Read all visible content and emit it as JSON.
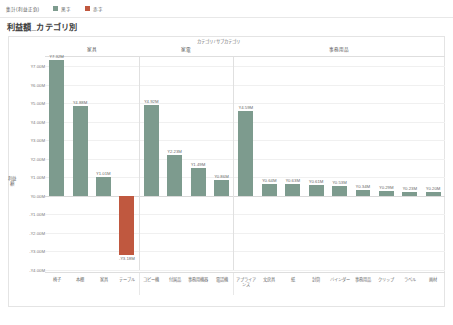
{
  "legend": {
    "title": "集計(利益正負)",
    "items": [
      {
        "label": "黒字",
        "color": "#7d9b8e"
      },
      {
        "label": "赤字",
        "color": "#c0583f"
      }
    ]
  },
  "title": "利益額_カテゴリ別",
  "axis": {
    "y_title": "利益額",
    "header_caption": "カテゴリ / サブカテゴリ"
  },
  "chart_data": {
    "type": "bar",
    "title": "利益額_カテゴリ別",
    "xlabel": "カテゴリ / サブカテゴリ",
    "ylabel": "利益額",
    "ylim": [
      -4.0,
      7.5
    ],
    "ytick_labels": [
      "¥7.00M",
      "¥6.00M",
      "¥5.00M",
      "¥4.00M",
      "¥3.00M",
      "¥2.00M",
      "¥1.00M",
      "¥0.00M",
      "-¥1.00M",
      "-¥2.00M",
      "-¥3.00M",
      "-¥4.00M"
    ],
    "ytick_values": [
      7.0,
      6.0,
      5.0,
      4.0,
      3.0,
      2.0,
      1.0,
      0.0,
      -1.0,
      -2.0,
      -3.0,
      -4.0
    ],
    "grid": true,
    "legend_position": "top",
    "panels": [
      {
        "name": "家具",
        "categories": [
          "椅子",
          "本棚",
          "家具",
          "テーブル"
        ],
        "values": [
          7.32,
          4.88,
          1.01,
          -3.18
        ],
        "labels": [
          "¥7.32M",
          "¥4.88M",
          "¥1.01M",
          "-¥3.18M"
        ],
        "colors": [
          "#7d9b8e",
          "#7d9b8e",
          "#7d9b8e",
          "#c0583f"
        ]
      },
      {
        "name": "家電",
        "categories": [
          "コピー機",
          "付属品",
          "事務用機器",
          "電話機"
        ],
        "values": [
          4.92,
          2.23,
          1.49,
          0.86
        ],
        "labels": [
          "¥4.92M",
          "¥2.23M",
          "¥1.49M",
          "¥0.86M"
        ],
        "colors": [
          "#7d9b8e",
          "#7d9b8e",
          "#7d9b8e",
          "#7d9b8e"
        ]
      },
      {
        "name": "事務用品",
        "categories": [
          "アプライアンス",
          "文房具",
          "紙",
          "封筒",
          "バインダー",
          "事務用品",
          "クリップ",
          "ラベル",
          "画材"
        ],
        "values": [
          4.59,
          0.64,
          0.63,
          0.61,
          0.53,
          0.34,
          0.29,
          0.23,
          0.2
        ],
        "labels": [
          "¥4.59M",
          "¥0.64M",
          "¥0.63M",
          "¥0.61M",
          "¥0.53M",
          "¥0.34M",
          "¥0.29M",
          "¥0.23M",
          "¥0.20M"
        ],
        "colors": [
          "#7d9b8e",
          "#7d9b8e",
          "#7d9b8e",
          "#7d9b8e",
          "#7d9b8e",
          "#7d9b8e",
          "#7d9b8e",
          "#7d9b8e",
          "#7d9b8e"
        ]
      }
    ]
  }
}
